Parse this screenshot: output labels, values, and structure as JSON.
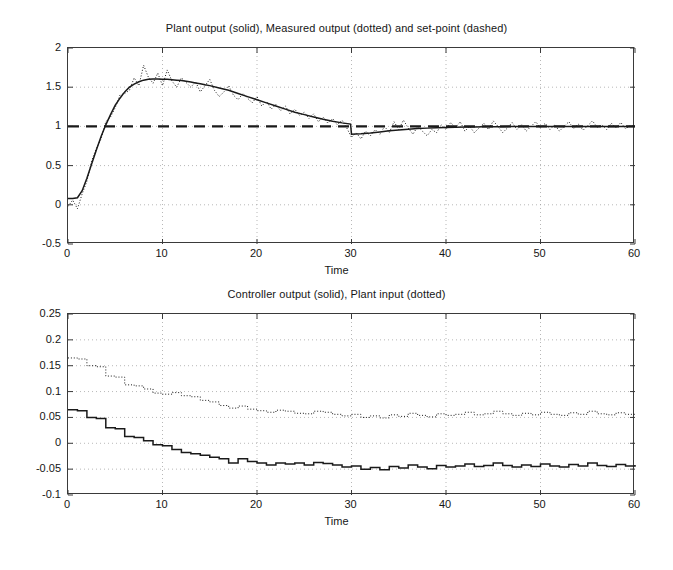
{
  "figure": {
    "width": 673,
    "height": 570,
    "background": "#ffffff",
    "axis_color": "#3a3a3a",
    "grid_color": "#9a9a9a",
    "line_color": "#1a1a1a"
  },
  "panels": [
    {
      "id": "plant-output-panel",
      "title": "Plant output (solid), Measured output (dotted) and set-point (dashed)",
      "xlabel": "Time",
      "ylabel": "",
      "xticks": [
        0,
        10,
        20,
        30,
        40,
        50,
        60
      ],
      "xtick_labels": [
        "0",
        "10",
        "20",
        "30",
        "40",
        "50",
        "60"
      ],
      "yticks": [
        -0.5,
        0,
        0.5,
        1,
        1.5,
        2
      ],
      "ytick_labels": [
        "-0.5",
        "0",
        "0.5",
        "1",
        "1.5",
        "2"
      ],
      "xlim": [
        0,
        60
      ],
      "ylim": [
        -0.5,
        2
      ],
      "grid": true
    },
    {
      "id": "controller-output-panel",
      "title": "Controller output (solid), Plant input (dotted)",
      "xlabel": "Time",
      "ylabel": "",
      "xticks": [
        0,
        10,
        20,
        30,
        40,
        50,
        60
      ],
      "xtick_labels": [
        "0",
        "10",
        "20",
        "30",
        "40",
        "50",
        "60"
      ],
      "yticks": [
        -0.1,
        -0.05,
        0,
        0.05,
        0.1,
        0.15,
        0.2,
        0.25
      ],
      "ytick_labels": [
        "-0.1",
        "-0.05",
        "0",
        "0.05",
        "0.1",
        "0.15",
        "0.2",
        "0.25"
      ],
      "xlim": [
        0,
        60
      ],
      "ylim": [
        -0.1,
        0.25
      ],
      "grid": true
    }
  ],
  "chart_data": [
    {
      "type": "line",
      "title": "Plant output (solid), Measured output (dotted) and set-point (dashed)",
      "xlabel": "Time",
      "ylabel": "",
      "xlim": [
        0,
        60
      ],
      "ylim": [
        -0.5,
        2
      ],
      "grid": true,
      "legend": [
        "Plant output (solid)",
        "Measured output (dotted)",
        "set-point (dashed)"
      ],
      "legend_position": "in-title",
      "series": [
        {
          "name": "Plant output (solid)",
          "style": "solid",
          "x": [
            0,
            0.5,
            1,
            1.5,
            2,
            2.5,
            3,
            3.5,
            4,
            4.5,
            5,
            5.5,
            6,
            6.5,
            7,
            7.5,
            8,
            8.5,
            9,
            9.5,
            10,
            10.5,
            11,
            11.5,
            12,
            12.5,
            13,
            13.5,
            14,
            14.5,
            15,
            16,
            17,
            18,
            19,
            20,
            21,
            22,
            23,
            24,
            25,
            26,
            27,
            28,
            29,
            29.9,
            30,
            31,
            32,
            33,
            34,
            35,
            36,
            37,
            38,
            39,
            40,
            41,
            42,
            43,
            44,
            45,
            46,
            47,
            48,
            49,
            50,
            52,
            54,
            56,
            58,
            60
          ],
          "values": [
            0.08,
            0.08,
            0.09,
            0.18,
            0.34,
            0.52,
            0.7,
            0.87,
            1.02,
            1.15,
            1.27,
            1.36,
            1.44,
            1.5,
            1.54,
            1.57,
            1.59,
            1.6,
            1.605,
            1.605,
            1.6,
            1.6,
            1.595,
            1.59,
            1.585,
            1.575,
            1.565,
            1.555,
            1.545,
            1.53,
            1.52,
            1.49,
            1.46,
            1.42,
            1.38,
            1.34,
            1.3,
            1.26,
            1.22,
            1.18,
            1.15,
            1.12,
            1.09,
            1.065,
            1.045,
            1.03,
            0.9,
            0.905,
            0.915,
            0.93,
            0.945,
            0.955,
            0.965,
            0.972,
            0.978,
            0.982,
            0.986,
            0.989,
            0.991,
            0.993,
            0.995,
            0.996,
            0.997,
            0.998,
            0.999,
            0.999,
            1.0,
            1.0,
            1.0,
            1.0,
            1.0,
            1.0
          ]
        },
        {
          "name": "Measured output (dotted)",
          "style": "dotted",
          "x": [
            0,
            0.5,
            1,
            1.5,
            2,
            2.5,
            3,
            3.5,
            4,
            4.5,
            5,
            5.5,
            6,
            6.5,
            7,
            7.5,
            8,
            8.5,
            9,
            9.5,
            10,
            10.5,
            11,
            11.5,
            12,
            12.5,
            13,
            13.5,
            14,
            14.5,
            15,
            15.5,
            16,
            16.5,
            17,
            17.5,
            18,
            18.5,
            19,
            19.5,
            20,
            20.5,
            21,
            21.5,
            22,
            22.5,
            23,
            23.5,
            24,
            24.5,
            25,
            25.5,
            26,
            26.5,
            27,
            27.5,
            28,
            28.5,
            29,
            29.5,
            30,
            30.5,
            31,
            31.5,
            32,
            32.5,
            33,
            33.5,
            34,
            34.5,
            35,
            35.5,
            36,
            36.5,
            37,
            37.5,
            38,
            38.5,
            39,
            39.5,
            40,
            40.5,
            41,
            41.5,
            42,
            42.5,
            43,
            43.5,
            44,
            44.5,
            45,
            45.5,
            46,
            46.5,
            47,
            47.5,
            48,
            48.5,
            49,
            49.5,
            50,
            50.5,
            51,
            51.5,
            52,
            52.5,
            53,
            53.5,
            54,
            54.5,
            55,
            55.5,
            56,
            56.5,
            57,
            57.5,
            58,
            58.5,
            59,
            59.5,
            60
          ],
          "values": [
            -0.02,
            0.06,
            -0.05,
            0.14,
            0.3,
            0.56,
            0.72,
            0.84,
            1.06,
            1.12,
            1.24,
            1.4,
            1.42,
            1.46,
            1.62,
            1.52,
            1.78,
            1.63,
            1.55,
            1.68,
            1.52,
            1.72,
            1.58,
            1.5,
            1.62,
            1.56,
            1.5,
            1.57,
            1.44,
            1.52,
            1.6,
            1.46,
            1.38,
            1.44,
            1.52,
            1.4,
            1.34,
            1.42,
            1.36,
            1.3,
            1.38,
            1.26,
            1.32,
            1.22,
            1.28,
            1.2,
            1.26,
            1.16,
            1.22,
            1.14,
            1.18,
            1.1,
            1.16,
            1.06,
            1.12,
            1.04,
            1.1,
            1.02,
            1.08,
            0.98,
            0.86,
            0.92,
            0.84,
            0.94,
            0.88,
            0.96,
            0.9,
            1.0,
            0.92,
            1.06,
            0.96,
            1.08,
            0.98,
            0.9,
            1.0,
            0.94,
            0.88,
            0.96,
            0.92,
            1.02,
            0.96,
            1.05,
            0.98,
            1.06,
            0.94,
            1.0,
            0.92,
            0.98,
            1.04,
            0.96,
            1.07,
            1.0,
            0.92,
            0.98,
            1.05,
            0.96,
            1.02,
            0.94,
            1.0,
            1.06,
            0.98,
            1.04,
            0.96,
            1.02,
            0.94,
            1.0,
            1.06,
            0.97,
            1.03,
            0.95,
            1.01,
            1.07,
            0.99,
            1.02,
            0.96,
            1.04,
            0.98,
            1.05,
            0.97,
            1.01,
            1.0,
            1.0
          ]
        },
        {
          "name": "set-point (dashed)",
          "style": "dashed",
          "x": [
            0,
            60
          ],
          "values": [
            1.0,
            1.0
          ]
        }
      ]
    },
    {
      "type": "line",
      "title": "Controller output (solid), Plant input (dotted)",
      "xlabel": "Time",
      "ylabel": "",
      "xlim": [
        0,
        60
      ],
      "ylim": [
        -0.1,
        0.25
      ],
      "grid": true,
      "legend": [
        "Controller output (solid)",
        "Plant input (dotted)"
      ],
      "legend_position": "in-title",
      "series": [
        {
          "name": "Controller output (solid)",
          "style": "solid-step",
          "x": [
            0,
            1,
            2,
            3,
            4,
            5,
            6,
            7,
            8,
            9,
            10,
            11,
            12,
            13,
            14,
            15,
            16,
            17,
            18,
            19,
            20,
            21,
            22,
            23,
            24,
            25,
            26,
            27,
            28,
            29,
            30,
            31,
            32,
            33,
            34,
            35,
            36,
            37,
            38,
            39,
            40,
            41,
            42,
            43,
            44,
            45,
            46,
            47,
            48,
            49,
            50,
            51,
            52,
            53,
            54,
            55,
            56,
            57,
            58,
            59,
            60
          ],
          "values": [
            0.065,
            0.063,
            0.05,
            0.048,
            0.03,
            0.028,
            0.013,
            0.011,
            0.005,
            -0.003,
            -0.005,
            -0.012,
            -0.018,
            -0.02,
            -0.023,
            -0.027,
            -0.03,
            -0.038,
            -0.03,
            -0.035,
            -0.038,
            -0.042,
            -0.038,
            -0.04,
            -0.038,
            -0.042,
            -0.037,
            -0.039,
            -0.042,
            -0.046,
            -0.044,
            -0.05,
            -0.047,
            -0.051,
            -0.045,
            -0.048,
            -0.042,
            -0.046,
            -0.049,
            -0.043,
            -0.046,
            -0.044,
            -0.04,
            -0.045,
            -0.043,
            -0.038,
            -0.043,
            -0.046,
            -0.042,
            -0.045,
            -0.04,
            -0.044,
            -0.046,
            -0.041,
            -0.044,
            -0.038,
            -0.043,
            -0.045,
            -0.041,
            -0.044,
            -0.042
          ]
        },
        {
          "name": "Plant input (dotted)",
          "style": "dotted-step",
          "x": [
            0,
            1,
            2,
            3,
            4,
            5,
            6,
            7,
            8,
            9,
            10,
            11,
            12,
            13,
            14,
            15,
            16,
            17,
            18,
            19,
            20,
            21,
            22,
            23,
            24,
            25,
            26,
            27,
            28,
            29,
            30,
            31,
            32,
            33,
            34,
            35,
            36,
            37,
            38,
            39,
            40,
            41,
            42,
            43,
            44,
            45,
            46,
            47,
            48,
            49,
            50,
            51,
            52,
            53,
            54,
            55,
            56,
            57,
            58,
            59,
            60
          ],
          "values": [
            0.165,
            0.163,
            0.15,
            0.148,
            0.13,
            0.128,
            0.113,
            0.111,
            0.105,
            0.097,
            0.095,
            0.098,
            0.092,
            0.09,
            0.083,
            0.08,
            0.073,
            0.068,
            0.072,
            0.066,
            0.063,
            0.06,
            0.064,
            0.062,
            0.058,
            0.057,
            0.062,
            0.06,
            0.056,
            0.053,
            0.056,
            0.05,
            0.053,
            0.049,
            0.055,
            0.052,
            0.058,
            0.054,
            0.051,
            0.057,
            0.054,
            0.056,
            0.06,
            0.055,
            0.057,
            0.062,
            0.057,
            0.054,
            0.058,
            0.055,
            0.06,
            0.056,
            0.054,
            0.059,
            0.056,
            0.062,
            0.057,
            0.055,
            0.059,
            0.056,
            0.058
          ]
        }
      ]
    }
  ]
}
